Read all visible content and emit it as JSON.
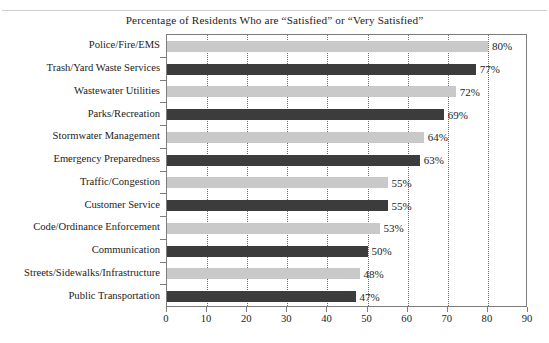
{
  "chart_data": {
    "type": "bar",
    "orientation": "horizontal",
    "title": "Percentage of Residents Who are “Satisfied” or “Very Satisfied”",
    "xlabel": "",
    "ylabel": "",
    "xlim": [
      0,
      90
    ],
    "xticks": [
      0,
      10,
      20,
      30,
      40,
      50,
      60,
      70,
      80,
      90
    ],
    "xtick_labels": [
      "0",
      "10",
      "20",
      "30",
      "40",
      "50",
      "60",
      "70",
      "80",
      "90"
    ],
    "grid": "vertical-dotted",
    "legend": "none",
    "value_suffix": "%",
    "categories": [
      "Police/Fire/EMS",
      "Trash/Yard Waste Services",
      "Wastewater Utilities",
      "Parks/Recreation",
      "Stormwater Management",
      "Emergency Preparedness",
      "Traffic/Congestion",
      "Customer Service",
      "Code/Ordinance Enforcement",
      "Communication",
      "Streets/Sidewalks/Infrastructure",
      "Public Transportation"
    ],
    "values": [
      80,
      77,
      72,
      69,
      64,
      63,
      55,
      55,
      53,
      50,
      48,
      47
    ],
    "value_labels": [
      "80%",
      "77%",
      "72%",
      "69%",
      "64%",
      "63%",
      "55%",
      "55%",
      "53%",
      "50%",
      "48%",
      "47%"
    ],
    "bar_colors": [
      "#c9c9c9",
      "#3c3c3c",
      "#c9c9c9",
      "#3c3c3c",
      "#c9c9c9",
      "#3c3c3c",
      "#c9c9c9",
      "#3c3c3c",
      "#c9c9c9",
      "#3c3c3c",
      "#c9c9c9",
      "#3c3c3c"
    ],
    "colors": {
      "light_bar": "#c9c9c9",
      "dark_bar": "#3c3c3c",
      "axis": "#7d7d7d",
      "gridline": "#6b6b6b",
      "text": "#1c1c1c",
      "background": "#ffffff"
    }
  }
}
